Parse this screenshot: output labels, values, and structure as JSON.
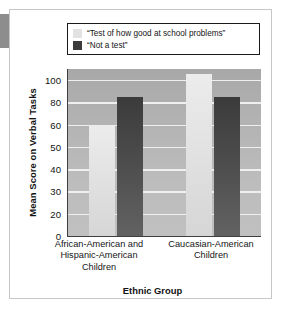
{
  "figure": {
    "background_color": "#ffffff",
    "frame_color": "#c7c7c7",
    "plot_background_color": "#b4b4b4",
    "gridline_color": "#efefef"
  },
  "legend": {
    "position": "top",
    "border_color": "#1b1b1b",
    "entries": [
      {
        "label": "“Test of how good at school problems”",
        "color": "#e2e2e2"
      },
      {
        "label": "“Not a test”",
        "color": "#3b3b3b"
      }
    ]
  },
  "chart_data": {
    "type": "bar",
    "title": "",
    "xlabel": "Ethnic Group",
    "ylabel": "Mean Score on Verbal Tasks",
    "categories": [
      "African-American and Hispanic-American Children",
      "Caucasian-American Children"
    ],
    "category_lines": [
      [
        "African-American and",
        "Hispanic-American",
        "Children"
      ],
      [
        "Caucasian-American",
        "Children"
      ]
    ],
    "series": [
      {
        "name": "“Test of how good at school problems”",
        "color": "#e2e2e2",
        "values": [
          60,
          105
        ]
      },
      {
        "name": "“Not a test”",
        "color": "#3b3b3b",
        "values": [
          85,
          85
        ]
      }
    ],
    "ytick_labels": [
      "100",
      "80",
      "60",
      "50",
      "40",
      "30",
      "20",
      "0"
    ],
    "ytick_values": [
      100,
      80,
      60,
      50,
      40,
      30,
      20,
      0
    ],
    "ylim": [
      0,
      107
    ],
    "axis_note": "tick labels are evenly spaced on the drawn axis (non-linear spacing between 60-80-100)",
    "grid": true,
    "legend_position": "top"
  }
}
